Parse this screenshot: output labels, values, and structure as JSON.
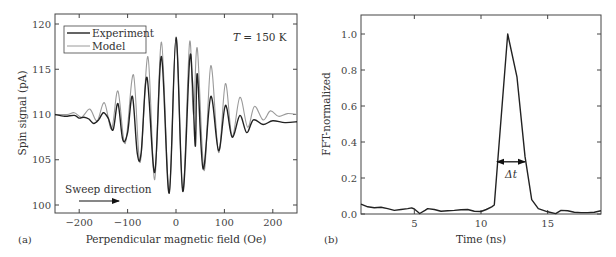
{
  "chart_data": [
    {
      "panel": "(a)",
      "type": "line",
      "title": "",
      "annotation": "T = 150 K",
      "annotation_parts": {
        "var": "T",
        "rest": " = 150 K"
      },
      "arrow_annotation": "Sweep direction",
      "xlabel": "Perpendicular magnetic field (Oe)",
      "ylabel": "Spin signal (pA)",
      "xlim": [
        -250,
        250
      ],
      "ylim": [
        99,
        121
      ],
      "xticks": [
        -200,
        -100,
        0,
        100,
        200
      ],
      "xtick_labels": [
        "−200",
        "−100",
        "0",
        "100",
        "200"
      ],
      "yticks": [
        100,
        105,
        110,
        115,
        120
      ],
      "ytick_labels": [
        "100",
        "105",
        "110",
        "115",
        "120"
      ],
      "grid": false,
      "legend_position": "upper left",
      "series": [
        {
          "name": "Experiment",
          "color": "#222222",
          "x": [
            -250,
            -230,
            -210,
            -200,
            -190,
            -180,
            -170,
            -160,
            -150,
            -140,
            -130,
            -120,
            -110,
            -100,
            -90,
            -80,
            -72,
            -60,
            -44,
            -30,
            -14,
            0,
            14,
            28,
            34,
            40,
            44,
            56,
            72,
            88,
            102,
            116,
            132,
            146,
            160,
            180,
            200,
            225,
            250
          ],
          "y": [
            110.0,
            109.8,
            109.9,
            109.6,
            109.7,
            109.5,
            109.0,
            109.4,
            110.2,
            109.6,
            108.3,
            111.2,
            107.2,
            108.0,
            112.0,
            105.7,
            105.8,
            114.1,
            103.6,
            116.4,
            101.3,
            118.5,
            101.5,
            116.0,
            113.5,
            106.5,
            114.5,
            104.0,
            112.0,
            106.0,
            111.0,
            107.5,
            109.9,
            108.0,
            109.4,
            108.9,
            109.3,
            109.1,
            109.2
          ]
        },
        {
          "name": "Model",
          "color": "#9a9a9a",
          "x": [
            -250,
            -225,
            -210,
            -195,
            -178,
            -163,
            -148,
            -133,
            -120,
            -105,
            -88,
            -74,
            -58,
            -44,
            -30,
            -14,
            0,
            14,
            28,
            36,
            44,
            58,
            72,
            88,
            102,
            116,
            132,
            148,
            162,
            180,
            195,
            212,
            230,
            250
          ],
          "y": [
            110.0,
            110.0,
            110.2,
            109.7,
            110.6,
            109.3,
            111.3,
            108.4,
            112.6,
            106.8,
            114.4,
            104.7,
            116.4,
            102.8,
            118.0,
            101.3,
            118.6,
            101.5,
            118.0,
            110.0,
            117.3,
            103.8,
            115.4,
            105.8,
            113.4,
            107.6,
            111.9,
            108.6,
            110.9,
            109.4,
            110.4,
            109.8,
            110.1,
            110.0
          ]
        }
      ]
    },
    {
      "panel": "(b)",
      "type": "line",
      "title": "",
      "annotation": "Δt",
      "xlabel": "Time (ns)",
      "ylabel": "FFT-normalized",
      "xlim": [
        1,
        19
      ],
      "ylim": [
        0,
        1.1
      ],
      "xticks": [
        5,
        10,
        15
      ],
      "xtick_labels": [
        "5",
        "10",
        "15"
      ],
      "yticks": [
        0.0,
        0.2,
        0.4,
        0.6,
        0.8,
        1.0
      ],
      "ytick_labels": [
        "0.0",
        "0.2",
        "0.4",
        "0.6",
        "0.8",
        "1.0"
      ],
      "grid": false,
      "series": [
        {
          "name": "FFT",
          "color": "#222222",
          "x": [
            1.0,
            1.5,
            2.0,
            2.5,
            3.0,
            3.5,
            4.0,
            4.5,
            4.8,
            5.0,
            5.4,
            5.8,
            6.0,
            6.5,
            7.0,
            7.5,
            8.0,
            8.5,
            9.0,
            9.5,
            10.0,
            10.4,
            10.8,
            11.0,
            12.0,
            12.7,
            13.3,
            13.8,
            14.3,
            15.0,
            15.6,
            16.0,
            16.5,
            17.0,
            17.5,
            18.0,
            18.5,
            19.0
          ],
          "y": [
            0.055,
            0.04,
            0.035,
            0.038,
            0.03,
            0.02,
            0.025,
            0.03,
            0.034,
            0.028,
            0.003,
            0.02,
            0.03,
            0.025,
            0.015,
            0.018,
            0.02,
            0.024,
            0.025,
            0.015,
            0.014,
            0.025,
            0.04,
            0.05,
            1.0,
            0.76,
            0.32,
            0.08,
            0.03,
            0.012,
            0.002,
            0.02,
            0.018,
            0.01,
            0.008,
            0.008,
            0.01,
            0.018
          ]
        }
      ],
      "delta_t_arrow": {
        "x_start": 11.2,
        "x_end": 13.3,
        "y": 0.29
      }
    }
  ],
  "panel_labels": {
    "a": "(a)",
    "b": "(b)"
  }
}
